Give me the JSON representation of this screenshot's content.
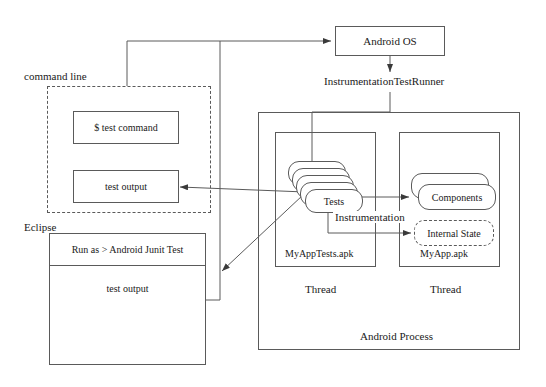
{
  "diagram": {
    "type": "architecture-block-diagram"
  },
  "nodes": {
    "android_os": {
      "label": "Android OS"
    },
    "instrumentation_test_runner": {
      "label": "InstrumentationTestRunner"
    },
    "command_line_group": {
      "label": "command line"
    },
    "test_command": {
      "label": "$ test command"
    },
    "cli_test_output": {
      "label": "test output"
    },
    "eclipse_group": {
      "label": "Eclipse"
    },
    "eclipse_menu": {
      "label": "Run as > Android Junit Test"
    },
    "eclipse_test_output": {
      "label": "test output"
    },
    "android_process": {
      "label": "Android Process"
    },
    "tests_thread": {
      "label": "Thread"
    },
    "app_thread": {
      "label": "Thread"
    },
    "myapptests_apk": {
      "label": "MyAppTests.apk"
    },
    "myapp_apk": {
      "label": "MyApp.apk"
    },
    "tests": {
      "label": "Tests"
    },
    "components": {
      "label": "Components"
    },
    "internal_state": {
      "label": "Internal State"
    },
    "instrumentation_edge": {
      "label": "Instrumentation"
    }
  },
  "colors": {
    "stroke": "#5a5a5a",
    "text": "#1a1a1a",
    "background": "#ffffff"
  }
}
